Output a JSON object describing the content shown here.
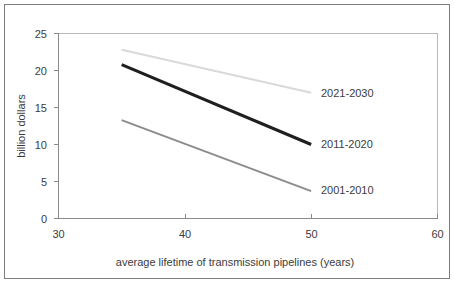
{
  "chart_data": {
    "type": "line",
    "title": "",
    "subtitle": "",
    "xlabel": "average lifetime of transmission pipelines (years)",
    "ylabel": "billion dollars",
    "xlim": [
      30,
      60
    ],
    "ylim": [
      0,
      25
    ],
    "xticks": [
      "30",
      "40",
      "50",
      "60"
    ],
    "xtick_values": [
      30,
      40,
      50,
      60
    ],
    "yticks": [
      "0",
      "5",
      "10",
      "15",
      "20",
      "25"
    ],
    "ytick_values": [
      0,
      5,
      10,
      15,
      20,
      25
    ],
    "grid": false,
    "legend_position": "inline-right-of-line-ends",
    "series": [
      {
        "name": "2021-2030",
        "color": "#d9d9d9",
        "width": 2,
        "x": [
          35,
          50
        ],
        "values": [
          22.8,
          17.0
        ]
      },
      {
        "name": "2011-2020",
        "color": "#1f1f1f",
        "width": 3,
        "x": [
          35,
          50
        ],
        "values": [
          20.8,
          10.0
        ]
      },
      {
        "name": "2001-2010",
        "color": "#8c8c8c",
        "width": 2,
        "x": [
          35,
          50
        ],
        "values": [
          13.3,
          3.7
        ]
      }
    ],
    "annotations": [
      {
        "text": "2021-2030",
        "x": 52.2,
        "y": 16.8
      },
      {
        "text": "2011-2020",
        "x": 52.2,
        "y": 9.8
      },
      {
        "text": "2001-2010",
        "x": 52.2,
        "y": 3.5
      }
    ]
  },
  "axes": {
    "x_title": "average lifetime of transmission pipelines (years)",
    "y_title": "billion dollars",
    "x_tick_labels": [
      "30",
      "40",
      "50",
      "60"
    ],
    "y_tick_labels": [
      "25",
      "20",
      "15",
      "10",
      "5",
      "0"
    ]
  },
  "series_labels": {
    "top": "2021-2030",
    "middle": "2011-2020",
    "bottom": "2001-2010"
  },
  "colors": {
    "series_top": "#d9d9d9",
    "series_middle": "#1f1f1f",
    "series_bottom": "#8c8c8c",
    "axis": "#8a8a8a",
    "text": "#3c3c3c",
    "frame": "#7d7d7d",
    "plot_border": "#b9b9b9",
    "background": "#ffffff"
  }
}
